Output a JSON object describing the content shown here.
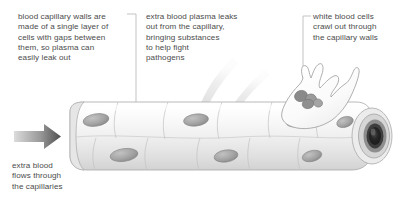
{
  "figure": {
    "background_color": "#ffffff",
    "text_color": "#4b4b4b"
  },
  "annotations": {
    "capillary_walls": {
      "text": "blood capillary walls are\nmade of a single layer of\ncells with gaps between\nthem, so plasma can\neasily leak out",
      "leader": "elbow-down-to-capillary"
    },
    "plasma_leak": {
      "text": "extra blood plasma leaks\nout from the capillary,\nbringing substances\nto help fight\npathogens",
      "leader": "none"
    },
    "white_blood_cells": {
      "text": "white blood cells\ncrawl out through\nthe capillary walls",
      "leader": "elbow-down-to-white-cell"
    },
    "blood_flow": {
      "text": "extra blood\nflows through\nthe capillaries",
      "leader": "arrow"
    }
  },
  "structures": {
    "capillary_tube": {
      "name": "capillary",
      "wall": "single layer of endothelial cells",
      "cell_count": 10,
      "nucleus_color": "#9a9a9a",
      "wall_fill": "#f2f2f2",
      "outline_color": "#9d9d9d"
    },
    "lumen_opening": {
      "name": "open end of capillary",
      "lumen_color": "#2e2e2e",
      "ring_colors": [
        "#3a3a3a",
        "#8c8c8c",
        "#d8d8d8"
      ]
    },
    "white_blood_cell": {
      "name": "white blood cell",
      "shape": "amoeboid with pseudopodia",
      "nucleus": "multi-lobed",
      "body_fill": "#fbfbfb",
      "nucleus_color": "#8f8f8f"
    },
    "plasma_streams": {
      "name": "leaking plasma",
      "count": 2,
      "color": "#e3e3e3"
    },
    "flow_arrow": {
      "name": "blood flow arrow",
      "direction": "right",
      "color_start": "#d9d9d9",
      "color_end": "#545454"
    }
  }
}
